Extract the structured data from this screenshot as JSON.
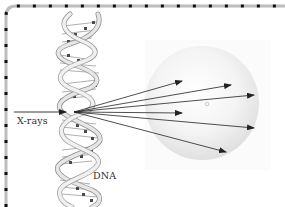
{
  "figure": {
    "type": "diagram",
    "labels": {
      "xrays": "X-rays",
      "dna": "DNA"
    },
    "colors": {
      "border_dash": "#111111",
      "border_track": "#bdbdbd",
      "sphere_fill": "#eeeeee",
      "arrow": "#222222",
      "helix_strand": "#d8d8d8",
      "base_pair": "#555555"
    },
    "incident_beam": {
      "from": [
        14,
        112
      ],
      "to": [
        65,
        112
      ]
    },
    "scatter_origin": [
      74,
      112
    ],
    "scattered_rays": [
      {
        "to": [
          182,
          81
        ]
      },
      {
        "to": [
          231,
          85
        ]
      },
      {
        "to": [
          254,
          95
        ]
      },
      {
        "to": [
          182,
          113
        ]
      },
      {
        "to": [
          254,
          128
        ]
      },
      {
        "to": [
          226,
          152
        ]
      }
    ],
    "sphere": {
      "cx": 202,
      "cy": 103,
      "r": 57
    },
    "sphere_center_marker": [
      207,
      104
    ]
  }
}
